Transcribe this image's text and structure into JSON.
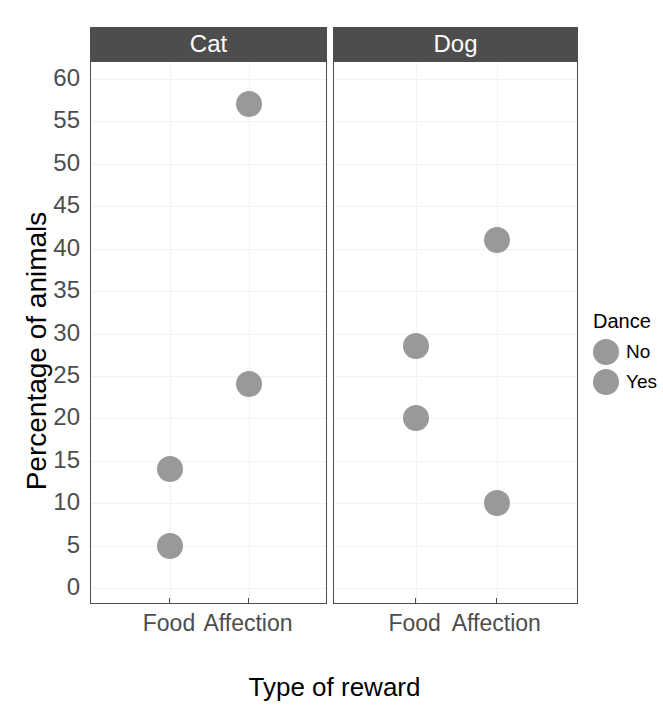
{
  "chart_data": {
    "type": "scatter",
    "title": "",
    "xlabel": "Type of reward",
    "ylabel": "Percentage of animals",
    "categories": [
      "Food",
      "Affection"
    ],
    "facet_variable": "Animal",
    "facets": [
      "Cat",
      "Dog"
    ],
    "legend": {
      "title": "Dance",
      "position": "right",
      "entries": [
        {
          "label": "No",
          "color": "#999999"
        },
        {
          "label": "Yes",
          "color": "#999999"
        }
      ]
    },
    "yticks": [
      0,
      5,
      10,
      15,
      20,
      25,
      30,
      35,
      40,
      45,
      50,
      55,
      60
    ],
    "ytick_labels": [
      "0",
      "5",
      "10",
      "15",
      "20",
      "25",
      "30",
      "35",
      "40",
      "45",
      "50",
      "55",
      "60"
    ],
    "ylim": [
      -2,
      62
    ],
    "grid": true,
    "series": [
      {
        "name": "No",
        "color": "#999999",
        "points": [
          {
            "facet": "Cat",
            "x": "Food",
            "y": 14
          },
          {
            "facet": "Cat",
            "x": "Affection",
            "y": 57
          },
          {
            "facet": "Dog",
            "x": "Food",
            "y": 28.5
          },
          {
            "facet": "Dog",
            "x": "Affection",
            "y": 41
          }
        ]
      },
      {
        "name": "Yes",
        "color": "#999999",
        "points": [
          {
            "facet": "Cat",
            "x": "Food",
            "y": 5
          },
          {
            "facet": "Cat",
            "x": "Affection",
            "y": 24
          },
          {
            "facet": "Dog",
            "x": "Food",
            "y": 20
          },
          {
            "facet": "Dog",
            "x": "Affection",
            "y": 10
          }
        ]
      }
    ],
    "panels": [
      {
        "strip_label": "Cat",
        "points": [
          {
            "x": "Food",
            "y": 14,
            "dance": "No"
          },
          {
            "x": "Food",
            "y": 5,
            "dance": "Yes"
          },
          {
            "x": "Affection",
            "y": 57,
            "dance": "No"
          },
          {
            "x": "Affection",
            "y": 24,
            "dance": "Yes"
          }
        ]
      },
      {
        "strip_label": "Dog",
        "points": [
          {
            "x": "Food",
            "y": 28.5,
            "dance": "No"
          },
          {
            "x": "Food",
            "y": 20,
            "dance": "Yes"
          },
          {
            "x": "Affection",
            "y": 41,
            "dance": "No"
          },
          {
            "x": "Affection",
            "y": 10,
            "dance": "Yes"
          }
        ]
      }
    ]
  },
  "colors": {
    "point": "#999999",
    "strip_background": "#4d4d4d",
    "strip_text": "#ffffff",
    "panel_border": "#4d4d4d",
    "gridline": "#f2f2f2",
    "axis_text": "#4d4d4d",
    "axis_title": "#000000",
    "background": "#ffffff"
  }
}
